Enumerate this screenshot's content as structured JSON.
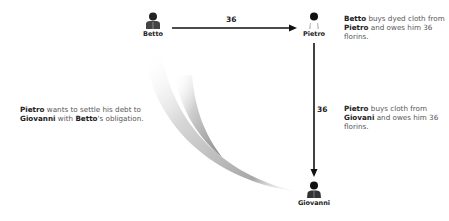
{
  "nodes": {
    "betto": {
      "label": "Betto",
      "icon": "person-icon"
    },
    "pietro": {
      "label": "Pietro",
      "icon": "person-icon"
    },
    "giovanni": {
      "label": "Giovanni",
      "icon": "person-icon"
    }
  },
  "edges": {
    "betto_to_pietro": {
      "amount": "36"
    },
    "pietro_to_giovanni": {
      "amount": "36"
    }
  },
  "descriptions": {
    "top_right": {
      "b1": "Betto",
      "t1": " buys dyed cloth from ",
      "b2": "Pietro",
      "t2": " and owes him 36 florins."
    },
    "middle_right": {
      "b1": "Pietro",
      "t1": " buys cloth from ",
      "b2": "Giovani",
      "t2": " and owes him 36 florins."
    },
    "left": {
      "b1": "Pietro",
      "t1": " wants to settle his debt to ",
      "b2": "Giovanni",
      "t2": " with ",
      "b3": "Betto",
      "t3": "'s obligation."
    }
  },
  "colors": {
    "line": "#111111",
    "swoosh": "#9a9a9a",
    "text": "#555555",
    "bold_text": "#222222"
  }
}
